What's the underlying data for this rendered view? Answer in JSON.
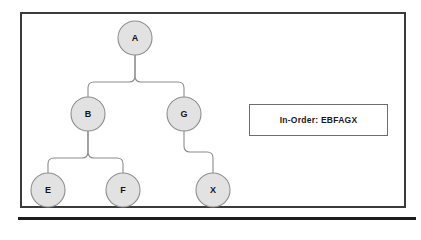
{
  "diagram": {
    "frame": {
      "border_color": "#3b3b3b",
      "background": "#ffffff"
    },
    "node_style": {
      "fill": "#e2e2e2",
      "stroke": "#8f8f8f",
      "radius": 17
    },
    "edge_style": {
      "stroke": "#8c8c8c"
    },
    "nodes": [
      {
        "id": "A",
        "label": "A",
        "cx": 135,
        "cy": 38,
        "level": 0
      },
      {
        "id": "B",
        "label": "B",
        "cx": 88,
        "cy": 114,
        "level": 1
      },
      {
        "id": "G",
        "label": "G",
        "cx": 184,
        "cy": 114,
        "level": 1
      },
      {
        "id": "E",
        "label": "E",
        "cx": 48,
        "cy": 190,
        "level": 2
      },
      {
        "id": "F",
        "label": "F",
        "cx": 123,
        "cy": 190,
        "level": 2
      },
      {
        "id": "X",
        "label": "X",
        "cx": 213,
        "cy": 190,
        "level": 2
      }
    ],
    "edges": [
      {
        "from": "A",
        "to": "B",
        "path": "M135,55 L135,76 Q135,82 129,82 L94,82 Q88,82 88,88 L88,97"
      },
      {
        "from": "A",
        "to": "G",
        "path": "M135,55 L135,76 Q135,82 141,82 L178,82 Q184,82 184,88 L184,97"
      },
      {
        "from": "B",
        "to": "E",
        "path": "M88,131 L88,152 Q88,158 82,158 L54,158 Q48,158 48,164 L48,173"
      },
      {
        "from": "B",
        "to": "F",
        "path": "M88,131 L88,152 Q88,158 94,158 L117,158 Q123,158 123,164 L123,173"
      },
      {
        "from": "G",
        "to": "X",
        "path": "M184,131 L184,146 Q184,152 190,152 L207,152 Q213,152 213,158 L213,173"
      }
    ]
  },
  "traversal": {
    "box_label": "In-Order: EBFAGX",
    "type_label": "In-Order",
    "sequence": "EBFAGX",
    "border_color": "#6e6e6e"
  },
  "bottom_rule": {
    "color": "#1c1c1c"
  }
}
